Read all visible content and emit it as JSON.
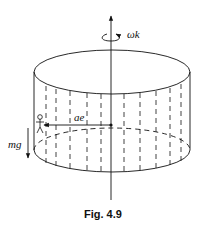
{
  "figure": {
    "caption": "Fig. 4.9",
    "labels": {
      "angular_velocity": "ωk",
      "acceleration": "ae",
      "gravity": "mg"
    }
  }
}
